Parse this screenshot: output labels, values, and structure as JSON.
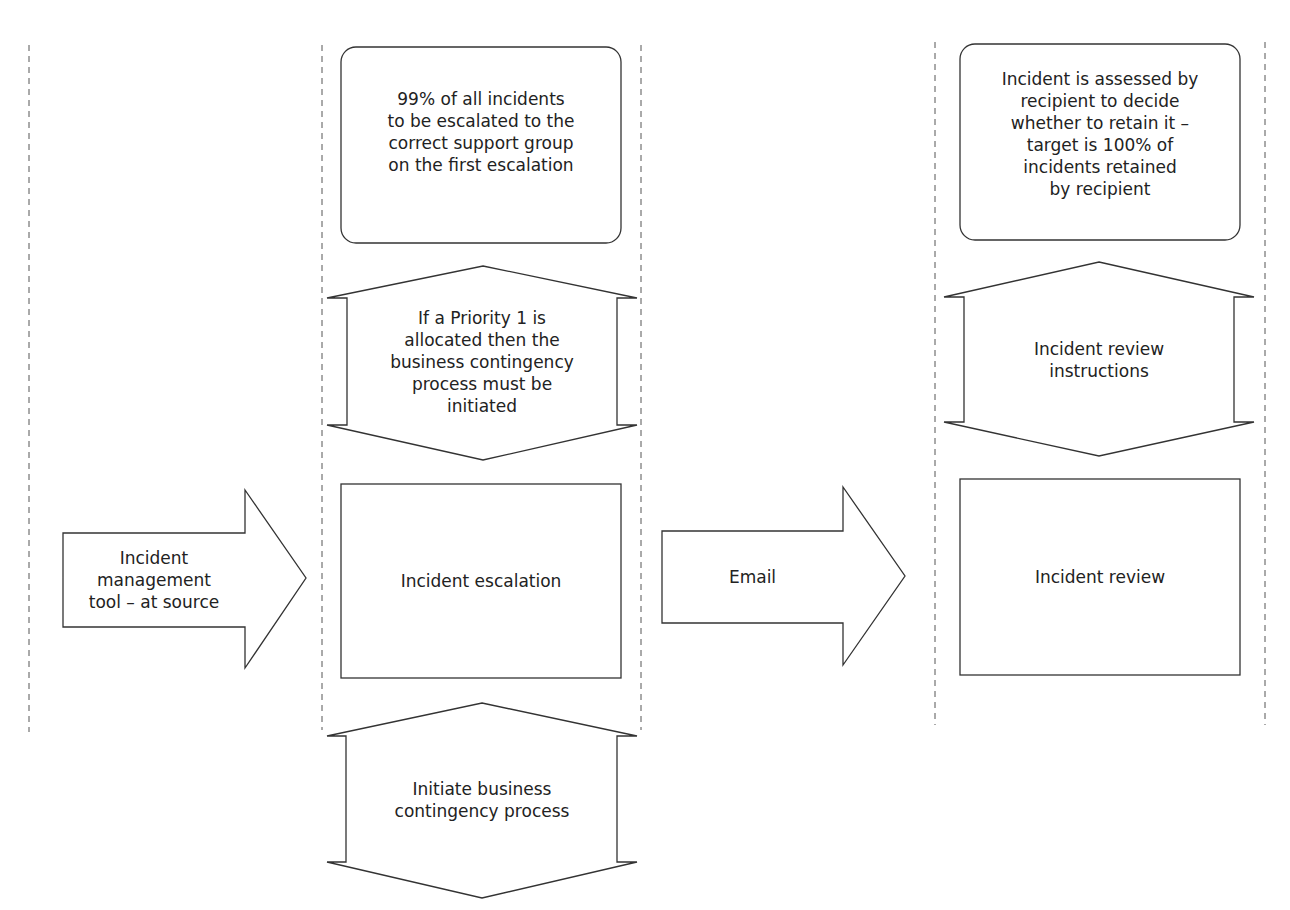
{
  "diagram": {
    "colors": {
      "stroke": "#333333",
      "fill": "#ffffff",
      "text": "#222222",
      "lane": "#555555"
    },
    "source": {
      "label": "Incident\nmanagement\ntool – at source",
      "shape": "right-arrow"
    },
    "escalation_lane": {
      "target": {
        "text": "99% of all incidents\nto be escalated to the\ncorrect support group\non the first escalation",
        "shape": "rounded-rect"
      },
      "control": {
        "text": "If a Priority 1 is\nallocated then the\nbusiness contingency\nprocess must be\ninitiated",
        "shape": "double-arrow"
      },
      "process": {
        "text": "Incident escalation",
        "shape": "rect"
      },
      "output": {
        "text": "Initiate business\ncontingency process",
        "shape": "double-arrow"
      }
    },
    "connector": {
      "label": "Email",
      "shape": "right-arrow"
    },
    "review_lane": {
      "target": {
        "text": "Incident is assessed by\nrecipient to decide\nwhether to retain it –\ntarget is 100% of\nincidents retained\nby recipient",
        "shape": "rounded-rect"
      },
      "control": {
        "text": "Incident review\ninstructions",
        "shape": "double-arrow"
      },
      "process": {
        "text": "Incident review",
        "shape": "rect"
      }
    }
  }
}
